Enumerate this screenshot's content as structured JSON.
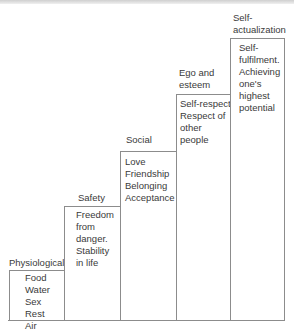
{
  "diagram": {
    "steps": [
      {
        "label": "Physiological",
        "content": "Food\nWater\nSex\nRest\nAir"
      },
      {
        "label": "Safety",
        "content": "Freedom\nfrom\ndanger.\nStability\nin life"
      },
      {
        "label": "Social",
        "content": "Love\nFriendship\nBelonging\nAcceptance"
      },
      {
        "label": "Ego and\nesteem",
        "content": "Self-respect.\nRespect of\nother\npeople"
      },
      {
        "label": "Self-\nactualization",
        "content": "Self-\nfulfilment.\nAchieving\none's\nhighest\npotential"
      }
    ]
  }
}
